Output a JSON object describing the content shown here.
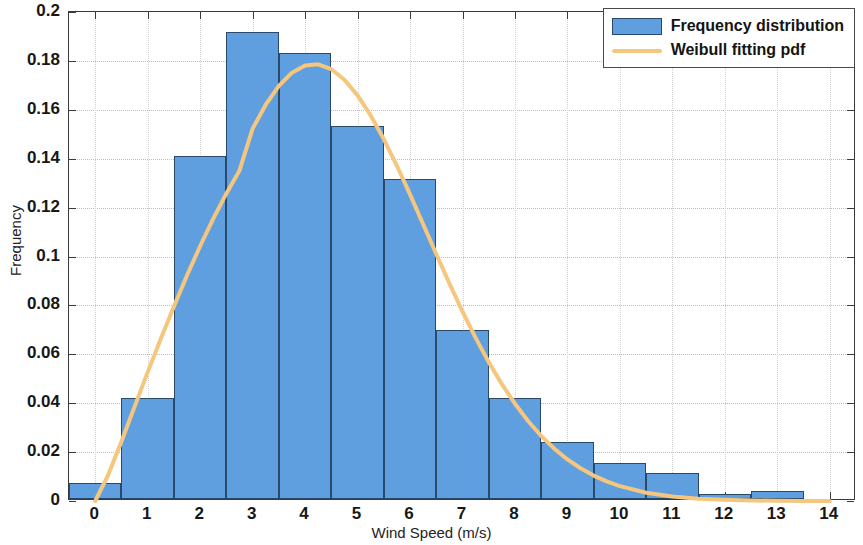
{
  "chart_data": {
    "type": "bar",
    "title": "",
    "xlabel": "Wind Speed (m/s)",
    "ylabel": "Frequency",
    "xlim": [
      -0.5,
      14.5
    ],
    "ylim": [
      0,
      0.2
    ],
    "grid": true,
    "legend_position": "top-right",
    "categories": [
      "0",
      "1",
      "2",
      "3",
      "4",
      "5",
      "6",
      "7",
      "8",
      "9",
      "10",
      "11",
      "12",
      "13",
      "14"
    ],
    "xticks": [
      0,
      1,
      2,
      3,
      4,
      5,
      6,
      7,
      8,
      9,
      10,
      11,
      12,
      13,
      14
    ],
    "xtick_labels": [
      "0",
      "1",
      "2",
      "3",
      "4",
      "5",
      "6",
      "7",
      "8",
      "9",
      "10",
      "11",
      "12",
      "13",
      "14"
    ],
    "yticks": [
      0,
      0.02,
      0.04,
      0.06,
      0.08,
      0.1,
      0.12,
      0.14,
      0.16,
      0.18,
      0.2
    ],
    "ytick_labels": [
      "0",
      "0.02",
      "0.04",
      "0.06",
      "0.08",
      "0.1",
      "0.12",
      "0.14",
      "0.16",
      "0.18",
      "0.2"
    ],
    "series": [
      {
        "name": "Frequency distribution",
        "kind": "bar",
        "color": "#5F9FE0",
        "edge_color": "#2b4a6b",
        "x": [
          0,
          1,
          2,
          3,
          4,
          5,
          6,
          7,
          8,
          9,
          10,
          11,
          12,
          13,
          14
        ],
        "values": [
          0.0065,
          0.0412,
          0.1402,
          0.191,
          0.1823,
          0.1525,
          0.1308,
          0.069,
          0.0414,
          0.0234,
          0.0146,
          0.0106,
          0.0022,
          0.0032,
          0.0
        ]
      },
      {
        "name": "Weibull fitting pdf",
        "kind": "line",
        "color": "#F5C77E",
        "line_width": 4,
        "x": [
          0,
          0.25,
          0.5,
          0.75,
          1,
          1.25,
          1.5,
          1.75,
          2,
          2.25,
          2.5,
          2.75,
          3,
          3.25,
          3.5,
          3.75,
          4,
          4.25,
          4.5,
          4.75,
          5,
          5.25,
          5.5,
          5.75,
          6,
          6.25,
          6.5,
          6.75,
          7,
          7.25,
          7.5,
          7.75,
          8,
          8.25,
          8.5,
          8.75,
          9,
          9.25,
          9.5,
          9.75,
          10,
          10.5,
          11,
          11.5,
          12,
          12.5,
          13,
          13.5,
          14
        ],
        "values": [
          0.0,
          0.0108,
          0.0243,
          0.0386,
          0.0527,
          0.0664,
          0.0796,
          0.0923,
          0.1043,
          0.1155,
          0.1258,
          0.1352,
          0.1523,
          0.1621,
          0.1698,
          0.1752,
          0.1781,
          0.1786,
          0.1766,
          0.1723,
          0.1659,
          0.1577,
          0.148,
          0.1371,
          0.1254,
          0.1132,
          0.101,
          0.089,
          0.0775,
          0.0667,
          0.0568,
          0.0478,
          0.0398,
          0.0327,
          0.0266,
          0.0214,
          0.017,
          0.0134,
          0.0104,
          0.008,
          0.0061,
          0.0034,
          0.0018,
          0.0009,
          0.0005,
          0.0002,
          0.0001,
          0.0,
          0.0
        ]
      }
    ]
  },
  "legend": {
    "entries": [
      {
        "label": "Frequency distribution",
        "marker": "patch"
      },
      {
        "label": "Weibull fitting pdf",
        "marker": "line"
      }
    ]
  },
  "axes": {
    "x_title": "Wind Speed (m/s)",
    "y_title": "Frequency"
  },
  "colors": {
    "bar_fill": "#5F9FE0",
    "bar_edge": "#2b4a6b",
    "curve": "#F5C77E",
    "axis": "#3a3a3a",
    "grid": "#bdbdbd",
    "background": "#ffffff"
  }
}
